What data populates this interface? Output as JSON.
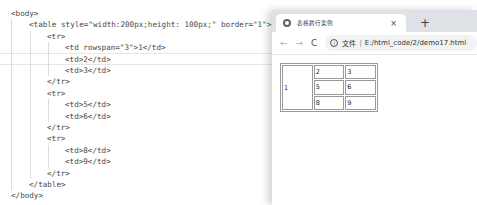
{
  "editor": {
    "lines": [
      {
        "indent": 0,
        "text": "<body>"
      },
      {
        "indent": 1,
        "text": "<table style=\"width:200px;height: 100px;\" border=\"1\">"
      },
      {
        "indent": 2,
        "text": "<tr>"
      },
      {
        "indent": 3,
        "text": "<td rowspan=\"3\">1</td>"
      },
      {
        "indent": 3,
        "text": "<td>2</td>"
      },
      {
        "indent": 3,
        "text": "<td>3</td>"
      },
      {
        "indent": 2,
        "text": "</tr>"
      },
      {
        "indent": 2,
        "text": "<tr>"
      },
      {
        "indent": 3,
        "text": "<td>5</td>"
      },
      {
        "indent": 3,
        "text": "<td>6</td>"
      },
      {
        "indent": 2,
        "text": "</tr>"
      },
      {
        "indent": 2,
        "text": "<tr>"
      },
      {
        "indent": 3,
        "text": "<td>8</td>"
      },
      {
        "indent": 3,
        "text": "<td>9</td>"
      },
      {
        "indent": 2,
        "text": "</tr>"
      },
      {
        "indent": 1,
        "text": "</table>"
      },
      {
        "indent": 0,
        "text": "</body>"
      }
    ],
    "current_line_index": 4
  },
  "browser": {
    "tab_title": "表格跨行案例",
    "tab_close": "×",
    "new_tab": "+",
    "back": "←",
    "forward": "→",
    "reload": "C",
    "info": "i",
    "url_label": "文件",
    "url_sep": "|",
    "url": "E:/html_code/2/demo17.html"
  },
  "table": {
    "rows": [
      [
        "1",
        "2",
        "3"
      ],
      [
        "5",
        "6"
      ],
      [
        "8",
        "9"
      ]
    ]
  }
}
